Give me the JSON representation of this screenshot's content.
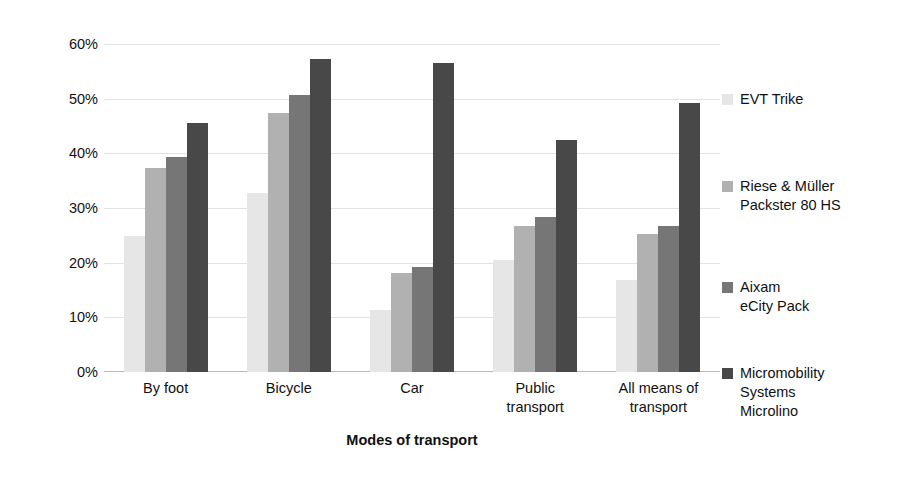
{
  "chart_data": {
    "type": "bar",
    "title": "",
    "xlabel": "Modes of transport",
    "ylabel": "Maximum substitutable trips [%]",
    "categories": [
      "By foot",
      "Bicycle",
      "Car",
      "Public\ntransport",
      "All means of\ntransport"
    ],
    "ytick_labels": [
      "0%",
      "10%",
      "20%",
      "30%",
      "40%",
      "50%",
      "60%"
    ],
    "ytick_values": [
      0,
      10,
      20,
      30,
      40,
      50,
      60
    ],
    "ylim": [
      0,
      60
    ],
    "grid": true,
    "legend_position": "right",
    "series": [
      {
        "name": "EVT Trike",
        "color": "#e6e6e6",
        "values": [
          24.9,
          32.7,
          11.3,
          20.5,
          16.8
        ]
      },
      {
        "name": "Riese & Müller\nPackster 80 HS",
        "color": "#b1b1b1",
        "values": [
          37.3,
          47.4,
          18.1,
          26.7,
          25.3
        ]
      },
      {
        "name": "Aixam\neCity Pack",
        "color": "#767676",
        "values": [
          39.4,
          50.7,
          19.3,
          28.4,
          26.8
        ]
      },
      {
        "name": "Micromobility\nSystems\nMicrolino",
        "color": "#484848",
        "values": [
          45.5,
          57.3,
          56.6,
          42.4,
          49.3
        ]
      }
    ]
  }
}
